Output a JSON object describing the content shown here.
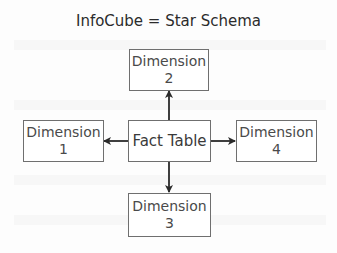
{
  "diagram": {
    "title": "InfoCube = Star Schema",
    "center": {
      "label": "Fact Table"
    },
    "dimensions": [
      {
        "id": "1",
        "line1": "Dimension",
        "line2": "1",
        "position": "left"
      },
      {
        "id": "2",
        "line1": "Dimension",
        "line2": "2",
        "position": "top"
      },
      {
        "id": "3",
        "line1": "Dimension",
        "line2": "3",
        "position": "bottom"
      },
      {
        "id": "4",
        "line1": "Dimension",
        "line2": "4",
        "position": "right"
      }
    ],
    "edges": [
      {
        "from": "Fact Table",
        "to": "Dimension 1"
      },
      {
        "from": "Fact Table",
        "to": "Dimension 2"
      },
      {
        "from": "Fact Table",
        "to": "Dimension 3"
      },
      {
        "from": "Fact Table",
        "to": "Dimension 4"
      }
    ],
    "colors": {
      "line": "#2a2a2a",
      "box_border": "#6f6f6f",
      "text": "#4a4a4a"
    }
  }
}
